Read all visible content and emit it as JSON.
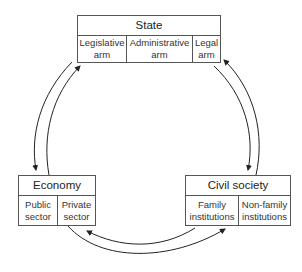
{
  "state": {
    "title": "State",
    "parts": [
      "Legislative arm",
      "Administrative arm",
      "Legal arm"
    ],
    "parts_lines": [
      [
        "Legislative",
        "arm"
      ],
      [
        "Administrative",
        "arm"
      ],
      [
        "Legal",
        "arm"
      ]
    ]
  },
  "economy": {
    "title": "Economy",
    "parts_lines": [
      [
        "Public",
        "sector"
      ],
      [
        "Private",
        "sector"
      ]
    ]
  },
  "civil_society": {
    "title": "Civil society",
    "parts_lines": [
      [
        "Family",
        "institutions"
      ],
      [
        "Non-family",
        "institutions"
      ]
    ]
  },
  "relations": [
    {
      "from": "state",
      "to": "economy",
      "bidirectional": true
    },
    {
      "from": "state",
      "to": "civil_society",
      "bidirectional": true
    },
    {
      "from": "economy",
      "to": "civil_society",
      "bidirectional": true
    }
  ],
  "colors": {
    "line": "#222222",
    "box_border": "#555555",
    "background": "#ffffff"
  }
}
